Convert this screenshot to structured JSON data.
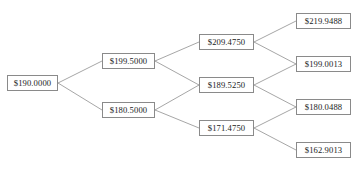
{
  "diagram": {
    "type": "binomial-price-tree",
    "title_fragment": "",
    "currency_symbol": "$",
    "colors": {
      "background": "#ffffff",
      "node_border": "#8a8a8a",
      "node_fill": "#ffffff",
      "edge": "#808080",
      "text": "#1a1a1a"
    },
    "nodes": [
      {
        "id": "n0",
        "label": "$190.0000",
        "x": 7,
        "y": 75,
        "w": 51
      },
      {
        "id": "n1u",
        "label": "$199.5000",
        "x": 102,
        "y": 53,
        "w": 53
      },
      {
        "id": "n1d",
        "label": "$180.5000",
        "x": 102,
        "y": 102,
        "w": 53
      },
      {
        "id": "n2uu",
        "label": "$209.4750",
        "x": 199,
        "y": 34,
        "w": 55
      },
      {
        "id": "n2ud",
        "label": "$189.5250",
        "x": 199,
        "y": 77,
        "w": 55
      },
      {
        "id": "n2dd",
        "label": "$171.4750",
        "x": 199,
        "y": 120,
        "w": 55
      },
      {
        "id": "n3a",
        "label": "$219.9488",
        "x": 296,
        "y": 13,
        "w": 55
      },
      {
        "id": "n3b",
        "label": "$199.0013",
        "x": 296,
        "y": 56,
        "w": 55
      },
      {
        "id": "n3c",
        "label": "$180.0488",
        "x": 296,
        "y": 99,
        "w": 55
      },
      {
        "id": "n3d",
        "label": "$162.9013",
        "x": 296,
        "y": 142,
        "w": 55
      }
    ],
    "edges": [
      {
        "from": "n0",
        "to": "n1u"
      },
      {
        "from": "n0",
        "to": "n1d"
      },
      {
        "from": "n1u",
        "to": "n2uu"
      },
      {
        "from": "n1u",
        "to": "n2ud"
      },
      {
        "from": "n1d",
        "to": "n2ud"
      },
      {
        "from": "n1d",
        "to": "n2dd"
      },
      {
        "from": "n2uu",
        "to": "n3a"
      },
      {
        "from": "n2uu",
        "to": "n3b"
      },
      {
        "from": "n2ud",
        "to": "n3b"
      },
      {
        "from": "n2ud",
        "to": "n3c"
      },
      {
        "from": "n2dd",
        "to": "n3c"
      },
      {
        "from": "n2dd",
        "to": "n3d"
      }
    ]
  }
}
